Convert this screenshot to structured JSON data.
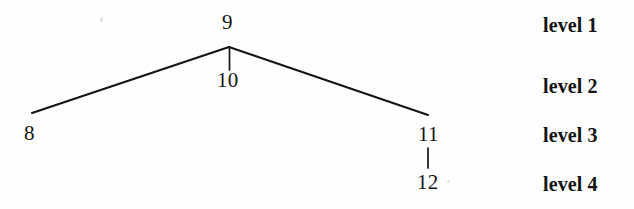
{
  "figure": {
    "background_color": "#fefefe",
    "ink_color": "#141414",
    "width": 634,
    "height": 209
  },
  "nodes": [
    {
      "id": "node-9",
      "label": "9",
      "level": 1,
      "x": 229,
      "y": 21
    },
    {
      "id": "node-10",
      "label": "10",
      "level": 2,
      "x": 229,
      "y": 80
    },
    {
      "id": "node-8",
      "label": "8",
      "level": 3,
      "x": 32,
      "y": 133
    },
    {
      "id": "node-11",
      "label": "11",
      "level": 3,
      "x": 428,
      "y": 134
    },
    {
      "id": "node-12",
      "label": "12",
      "level": 4,
      "x": 428,
      "y": 182
    }
  ],
  "edges": [
    {
      "id": "edge-9-8",
      "from": "9",
      "to": "8",
      "x1": 229,
      "y1": 47,
      "x2": 32,
      "y2": 113
    },
    {
      "id": "edge-9-11",
      "from": "9",
      "to": "11",
      "x1": 229,
      "y1": 47,
      "x2": 428,
      "y2": 115
    },
    {
      "id": "edge-9-10",
      "from": "9",
      "to": "10",
      "x1": 229,
      "y1": 47,
      "x2": 229,
      "y2": 70
    },
    {
      "id": "edge-11-12",
      "from": "11",
      "to": "12",
      "x1": 428,
      "y1": 148,
      "x2": 428,
      "y2": 168
    }
  ],
  "levels": [
    {
      "id": "level-1",
      "label": "level 1"
    },
    {
      "id": "level-2",
      "label": "level 2"
    },
    {
      "id": "level-3",
      "label": "level 3"
    },
    {
      "id": "level-4",
      "label": "level 4"
    }
  ]
}
